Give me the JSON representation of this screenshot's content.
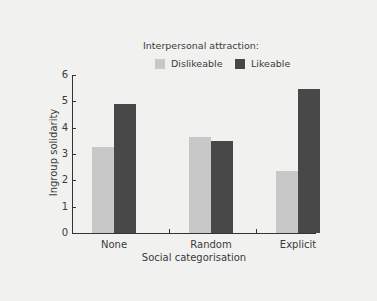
{
  "chart_data": {
    "type": "bar",
    "title": "",
    "legend_title": "Interpersonal attraction:",
    "legend_position": "top",
    "categories": [
      "None",
      "Random",
      "Explicit"
    ],
    "series": [
      {
        "name": "Dislikeable",
        "color": "#c8c8c8",
        "values": [
          3.25,
          3.65,
          2.35
        ]
      },
      {
        "name": "Likeable",
        "color": "#484848",
        "values": [
          4.9,
          3.5,
          5.45
        ]
      }
    ],
    "xlabel": "Social categorisation",
    "ylabel": "Ingroup solidarity",
    "ylim": [
      0,
      6
    ],
    "yticks": [
      0,
      1,
      2,
      3,
      4,
      5,
      6
    ],
    "grid": false
  }
}
